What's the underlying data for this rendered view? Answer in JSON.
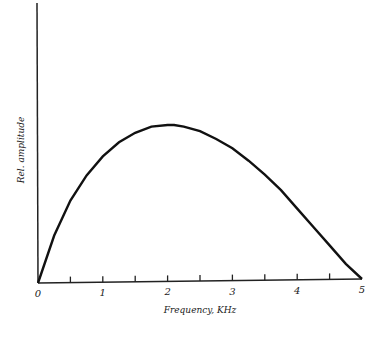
{
  "chart_data": {
    "type": "line",
    "title": "",
    "xlabel": "Frequency, KHz",
    "ylabel": "Rel. amplitude",
    "xlim": [
      0,
      5
    ],
    "ylim": [
      0,
      1
    ],
    "x_ticks": [
      "0",
      "1",
      "2",
      "3",
      "4",
      "5"
    ],
    "minor_ticks": [
      0.5,
      1.5,
      2.5,
      3.5,
      4.5
    ],
    "grid": false,
    "series": [
      {
        "name": "spectrum",
        "x": [
          0,
          0.25,
          0.5,
          0.75,
          1.0,
          1.25,
          1.5,
          1.75,
          2.0,
          2.1,
          2.25,
          2.5,
          2.75,
          3.0,
          3.25,
          3.5,
          3.75,
          4.0,
          4.25,
          4.5,
          4.75,
          5.0
        ],
        "values": [
          0,
          0.3,
          0.52,
          0.68,
          0.8,
          0.89,
          0.95,
          0.99,
          1.0,
          1.0,
          0.99,
          0.96,
          0.91,
          0.85,
          0.77,
          0.68,
          0.58,
          0.46,
          0.34,
          0.22,
          0.1,
          0
        ]
      }
    ],
    "colors": {
      "line": "#111111",
      "axis": "#222222"
    }
  }
}
